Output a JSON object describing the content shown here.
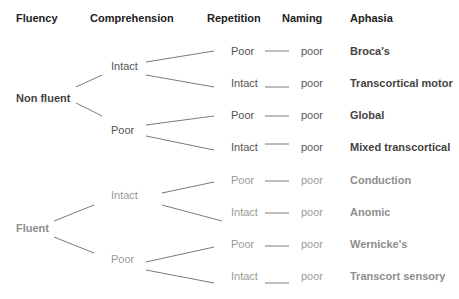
{
  "headers": {
    "fluency": "Fluency",
    "comprehension": "Comprehension",
    "repetition": "Repetition",
    "naming": "Naming",
    "aphasia": "Aphasia"
  },
  "fluency": [
    {
      "label": "Non fluent",
      "shade": "dark"
    },
    {
      "label": "Fluent",
      "shade": "light"
    }
  ],
  "comprehension": [
    {
      "label": "Intact",
      "parent": "Non fluent"
    },
    {
      "label": "Poor",
      "parent": "Non fluent"
    },
    {
      "label": "Intact",
      "parent": "Fluent"
    },
    {
      "label": "Poor",
      "parent": "Fluent"
    }
  ],
  "rows": [
    {
      "repetition": "Poor",
      "naming": "poor",
      "aphasia": "Broca's"
    },
    {
      "repetition": "Intact",
      "naming": "poor",
      "aphasia": "Transcortical motor"
    },
    {
      "repetition": "Poor",
      "naming": "poor",
      "aphasia": "Global"
    },
    {
      "repetition": "Intact",
      "naming": "poor",
      "aphasia": "Mixed transcortical"
    },
    {
      "repetition": "Poor",
      "naming": "poor",
      "aphasia": "Conduction"
    },
    {
      "repetition": "Intact",
      "naming": "poor",
      "aphasia": "Anomic"
    },
    {
      "repetition": "Poor",
      "naming": "poor",
      "aphasia": "Wernicke's"
    },
    {
      "repetition": "Intact",
      "naming": "poor",
      "aphasia": "Transcort sensory"
    }
  ],
  "colors": {
    "header": "#222222",
    "dark_text": "#555555",
    "light_text": "#9a9a9a",
    "line": "#777777"
  }
}
